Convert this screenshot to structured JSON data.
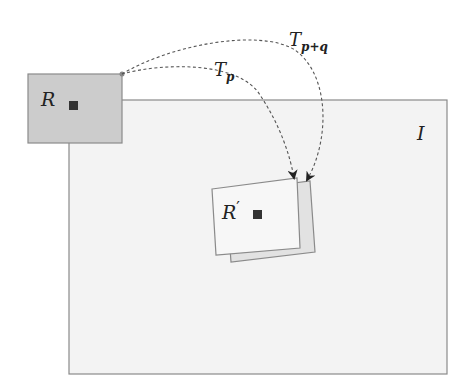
{
  "diagram": {
    "region_source": {
      "label": "R",
      "fill": "#cccccc",
      "stroke": "#8a8a8a"
    },
    "image_frame": {
      "label": "I",
      "fill": "#f3f3f3",
      "stroke": "#8a8a8a"
    },
    "region_target": {
      "label_base": "R",
      "label_prime": "′",
      "fill": "#f7f7f7",
      "back_fill": "#e2e2e2",
      "stroke": "#8a8a8a"
    },
    "center_marker_color": "#333333",
    "arrow_color": "#555555",
    "transforms": [
      {
        "id": "tp",
        "label_base": "T",
        "label_sub": "p"
      },
      {
        "id": "tpq",
        "label_base": "T",
        "label_sub": "p+q"
      }
    ]
  }
}
